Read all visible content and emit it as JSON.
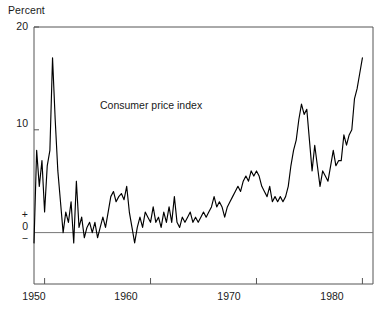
{
  "chart_data": {
    "type": "line",
    "title": "",
    "series_label": "Consumer price index",
    "xlabel": "",
    "ylabel": "Percent",
    "ylim": [
      -5,
      20
    ],
    "xlim": [
      1949.0,
      1981.0
    ],
    "grid": false,
    "legend_position": "inline-annotation",
    "y_tick_labels": [
      "20",
      "10",
      "+",
      "0",
      "−"
    ],
    "y_ticks": [
      20,
      10,
      0
    ],
    "x_ticks": [
      1950,
      1960,
      1970,
      1980
    ],
    "x_tick_labels": [
      "1950",
      "1960",
      "1970",
      "1980"
    ],
    "zero_line": 0,
    "line_color": "#000000",
    "axis_color": "#555555",
    "units_note": "Percent change",
    "x": [
      1949.0,
      1949.25,
      1949.5,
      1949.75,
      1950.0,
      1950.25,
      1950.5,
      1950.75,
      1951.0,
      1951.25,
      1951.5,
      1951.75,
      1952.0,
      1952.25,
      1952.5,
      1952.75,
      1953.0,
      1953.25,
      1953.5,
      1953.75,
      1954.0,
      1954.25,
      1954.5,
      1954.75,
      1955.0,
      1955.25,
      1955.5,
      1955.75,
      1956.0,
      1956.25,
      1956.5,
      1956.75,
      1957.0,
      1957.25,
      1957.5,
      1957.75,
      1958.0,
      1958.25,
      1958.5,
      1958.75,
      1959.0,
      1959.25,
      1959.5,
      1959.75,
      1960.0,
      1960.25,
      1960.5,
      1960.75,
      1961.0,
      1961.25,
      1961.5,
      1961.75,
      1962.0,
      1962.25,
      1962.5,
      1962.75,
      1963.0,
      1963.25,
      1963.5,
      1963.75,
      1964.0,
      1964.25,
      1964.5,
      1964.75,
      1965.0,
      1965.25,
      1965.5,
      1965.75,
      1966.0,
      1966.25,
      1966.5,
      1966.75,
      1967.0,
      1967.25,
      1967.5,
      1967.75,
      1968.0,
      1968.25,
      1968.5,
      1968.75,
      1969.0,
      1969.25,
      1969.5,
      1969.75,
      1970.0,
      1970.25,
      1970.5,
      1970.75,
      1971.0,
      1971.25,
      1971.5,
      1971.75,
      1972.0,
      1972.25,
      1972.5,
      1972.75,
      1973.0,
      1973.25,
      1973.5,
      1973.75,
      1974.0,
      1974.25,
      1974.5,
      1974.75,
      1975.0,
      1975.25,
      1975.5,
      1975.75,
      1976.0,
      1976.25,
      1976.5,
      1976.75,
      1977.0,
      1977.25,
      1977.5,
      1977.75,
      1978.0,
      1978.25,
      1978.5,
      1978.75,
      1979.0,
      1979.25,
      1979.5,
      1979.75,
      1980.0
    ],
    "values": [
      -1.0,
      8.0,
      4.5,
      7.0,
      2.0,
      6.5,
      8.0,
      17.0,
      11.0,
      6.0,
      3.0,
      0.0,
      2.0,
      1.0,
      3.0,
      -1.0,
      5.0,
      0.5,
      1.5,
      -0.5,
      0.5,
      1.0,
      0.0,
      1.0,
      -0.5,
      0.5,
      1.5,
      0.5,
      2.0,
      3.5,
      4.0,
      3.0,
      3.5,
      3.8,
      3.2,
      4.5,
      2.0,
      0.5,
      -1.0,
      0.5,
      1.5,
      0.5,
      2.0,
      1.5,
      1.0,
      2.5,
      1.0,
      1.5,
      0.5,
      2.0,
      1.0,
      2.5,
      1.0,
      3.5,
      1.0,
      0.5,
      1.5,
      1.0,
      1.5,
      2.0,
      1.0,
      1.5,
      1.0,
      1.5,
      2.0,
      1.5,
      2.0,
      2.5,
      3.5,
      2.5,
      3.0,
      2.5,
      1.5,
      2.5,
      3.0,
      3.5,
      4.0,
      4.5,
      4.0,
      5.0,
      5.5,
      5.0,
      6.0,
      5.5,
      6.0,
      5.5,
      4.5,
      4.0,
      3.5,
      4.5,
      3.0,
      3.5,
      3.0,
      3.5,
      3.0,
      3.5,
      4.5,
      6.5,
      8.0,
      9.0,
      11.0,
      12.5,
      11.5,
      12.0,
      9.0,
      6.0,
      8.5,
      6.5,
      4.5,
      6.0,
      5.5,
      5.0,
      6.5,
      8.0,
      6.5,
      7.0,
      7.0,
      9.5,
      8.5,
      9.5,
      10.0,
      13.0,
      14.0,
      15.5,
      17.0
    ]
  },
  "axis": {
    "unit_label": "Percent"
  }
}
